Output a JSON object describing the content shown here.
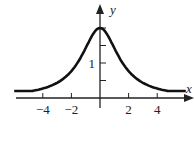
{
  "chart_data": {
    "type": "line",
    "title": "",
    "xlabel": "x",
    "ylabel": "y",
    "x_ticks": [
      -4,
      -2,
      2,
      4
    ],
    "x_tick_labels": [
      "−4",
      "−2",
      "2",
      "4"
    ],
    "y_ticks": [
      0.5,
      1,
      1.5,
      2
    ],
    "y_tick_labels": [
      "",
      "1",
      "",
      ""
    ],
    "xlim": [
      -6,
      6
    ],
    "ylim": [
      0,
      2.2
    ],
    "grid": false,
    "series": [
      {
        "name": "curve",
        "x": [
          -6,
          -5,
          -4,
          -3,
          -2,
          -1,
          0,
          1,
          2,
          3,
          4,
          5,
          6
        ],
        "y": [
          0.2,
          0.27,
          0.3,
          0.43,
          0.77,
          1.43,
          2.0,
          1.43,
          0.77,
          0.43,
          0.3,
          0.27,
          0.2
        ]
      }
    ]
  }
}
